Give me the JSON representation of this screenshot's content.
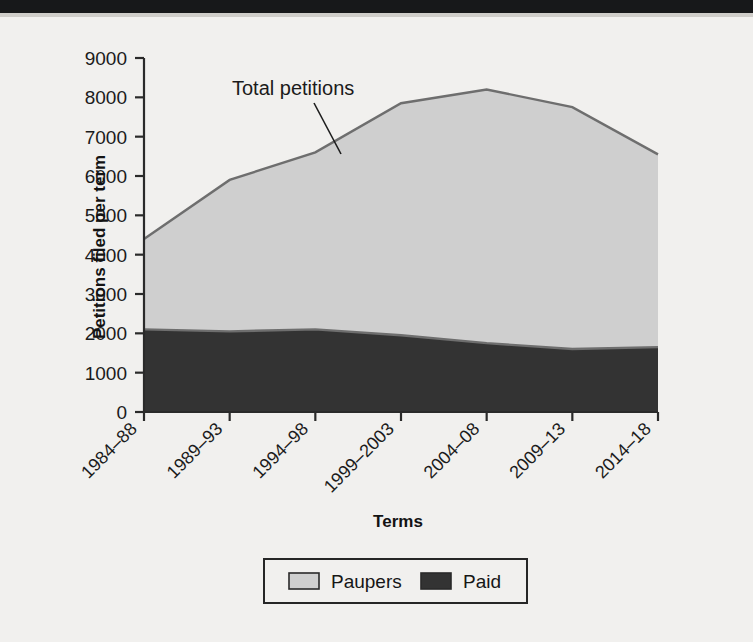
{
  "chart_data": {
    "type": "area",
    "stacked": true,
    "title": "",
    "xlabel": "Terms",
    "ylabel": "Petitions filed per term",
    "categories": [
      "1984–88",
      "1989–93",
      "1994–98",
      "1999–2003",
      "2004–08",
      "2009–13",
      "2014–18"
    ],
    "series": [
      {
        "name": "Paid",
        "values": [
          2100,
          2050,
          2100,
          1950,
          1750,
          1600,
          1650
        ],
        "color": "#333333"
      },
      {
        "name": "Paupers",
        "values": [
          2300,
          3850,
          4500,
          5900,
          6450,
          6150,
          4900
        ],
        "color": "#cfcfcf"
      }
    ],
    "totals": {
      "name": "Total petitions",
      "values": [
        4400,
        5900,
        6600,
        7850,
        8200,
        7750,
        6550
      ]
    },
    "ylim": [
      0,
      9000
    ],
    "yticks": [
      0,
      1000,
      2000,
      3000,
      4000,
      5000,
      6000,
      7000,
      8000,
      9000
    ],
    "ytick_labels": [
      "0",
      "1000",
      "2000",
      "3000",
      "4000",
      "5000",
      "6000",
      "7000",
      "8000",
      "9000"
    ],
    "grid": false,
    "legend_position": "bottom",
    "annotations": [
      {
        "text": "Total petitions",
        "points_to": "total-line"
      }
    ]
  },
  "axes": {
    "y_title": "Petitions filed per term",
    "x_title": "Terms"
  },
  "legend": {
    "items": [
      {
        "label": "Paupers",
        "swatch": "#cfcfcf"
      },
      {
        "label": "Paid",
        "swatch": "#333333"
      }
    ]
  },
  "annotation": {
    "total_petitions": "Total petitions"
  },
  "colors": {
    "paupers": "#cfcfcf",
    "paid": "#333333",
    "outline": "#6e6e6e",
    "axis": "#2a2a2a",
    "page_background": "#f1f0ee",
    "top_bar": "#17181a"
  }
}
